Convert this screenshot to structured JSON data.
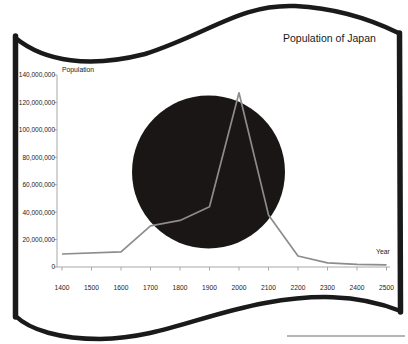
{
  "window": {
    "width": 408,
    "height": 344
  },
  "flag": {
    "background": "#ffffff",
    "border_color": "#1a1a1a",
    "disc_color": "#1b1616"
  },
  "chart_data": {
    "type": "line",
    "title": "Population of Japan",
    "xlabel": "Year",
    "ylabel": "Population",
    "x": [
      1400,
      1600,
      1700,
      1800,
      1900,
      2000,
      2100,
      2200,
      2300,
      2400,
      2500
    ],
    "values": [
      9500000,
      11000000,
      30000000,
      34000000,
      44000000,
      127000000,
      38000000,
      8000000,
      3000000,
      2000000,
      1500000
    ],
    "xlim": [
      1400,
      2500
    ],
    "ylim": [
      0,
      140000000
    ],
    "x_ticks": [
      1400,
      1500,
      1600,
      1700,
      1800,
      1900,
      2000,
      2100,
      2200,
      2300,
      2400,
      2500
    ],
    "y_ticks": [
      0,
      20000000,
      40000000,
      60000000,
      80000000,
      100000000,
      120000000,
      140000000
    ],
    "y_tick_labels": [
      "0",
      "20,000,000",
      "40,000,000",
      "60,000,000",
      "80,000,000",
      "100,000,000",
      "120,000,000",
      "140,000,000"
    ],
    "grid": false,
    "legend": false,
    "line_color": "#8c8c8c",
    "axis_color": "#a8a8a8",
    "tick_label_color": "#222222"
  },
  "artifact": {
    "color": "#b5b5b5"
  }
}
